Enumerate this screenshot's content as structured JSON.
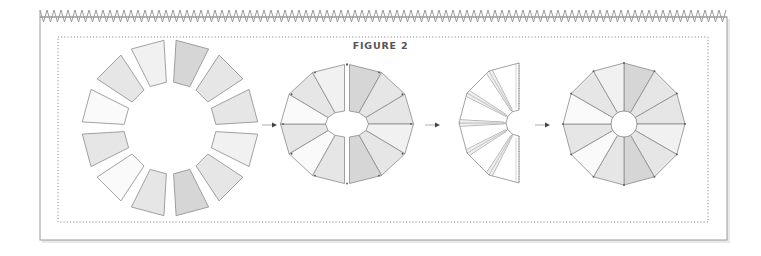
{
  "figure": {
    "title": "FIGURE 2",
    "colors": {
      "dark": "#d6d6d6",
      "mid": "#e6e6e6",
      "light": "#f1f1f1",
      "white": "#fafafa",
      "stroke": "#8a8a8a",
      "frame": "#9a9a9a",
      "dotted": "#777777",
      "arrow": "#444444"
    },
    "steps": [
      {
        "id": "step-1",
        "description": "12 separate wedge pieces arranged in a circle"
      },
      {
        "id": "step-2",
        "description": "wedges sewn into two halves"
      },
      {
        "id": "step-3",
        "description": "back of one half with seams pressed"
      },
      {
        "id": "step-4",
        "description": "completed 12-wedge dresden plate"
      }
    ],
    "wedge_shades": [
      "dark",
      "mid",
      "mid",
      "light",
      "mid",
      "dark",
      "mid",
      "white",
      "mid",
      "white",
      "mid",
      "light"
    ],
    "arrows": 3
  }
}
